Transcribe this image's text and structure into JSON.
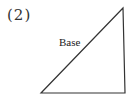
{
  "figure": {
    "number_label": "(2)",
    "shape": "right-triangle",
    "edge_label": "Base",
    "vertices": {
      "top_right": [
        123,
        8
      ],
      "bottom_left": [
        41,
        93
      ],
      "bottom_right": [
        125,
        93
      ]
    },
    "stroke_color": "#333333",
    "background_color": "#ffffff"
  }
}
